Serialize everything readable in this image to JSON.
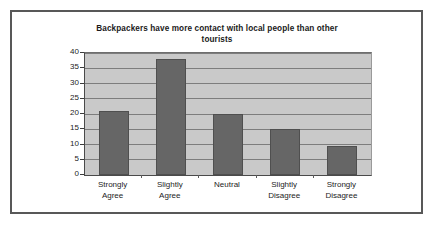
{
  "chart_data": {
    "type": "bar",
    "title": "Backpackers have more contact with local people than other tourists",
    "title_line1": "Backpackers have more contact with local people than other",
    "title_line2": "tourists",
    "xlabel": "",
    "ylabel": "",
    "categories": [
      "Strongly Agree",
      "Slightly Agree",
      "Neutral",
      "Slightly Disagree",
      "Strongly Disagree"
    ],
    "category_lines": [
      [
        "Strongly",
        "Agree"
      ],
      [
        "Slightly",
        "Agree"
      ],
      [
        "Neutral",
        ""
      ],
      [
        "Slightly",
        "Disagree"
      ],
      [
        "Strongly",
        "Disagree"
      ]
    ],
    "values": [
      21,
      38,
      20,
      15,
      9.5
    ],
    "ylim": [
      0,
      40
    ],
    "ytick_values": [
      0,
      5,
      10,
      15,
      20,
      25,
      30,
      35,
      40
    ],
    "ytick_labels": [
      "0",
      "5",
      "10",
      "15",
      "20",
      "25",
      "30",
      "35",
      "40"
    ],
    "grid": true,
    "legend": false,
    "colors": {
      "bar_fill": "#666666",
      "bar_border": "#4f4f4f",
      "plot_background": "#c9c9c9",
      "gridline": "#7d7d7d",
      "frame_border": "#585858",
      "page_background": "#ffffff",
      "text": "#1c1c1c"
    }
  }
}
